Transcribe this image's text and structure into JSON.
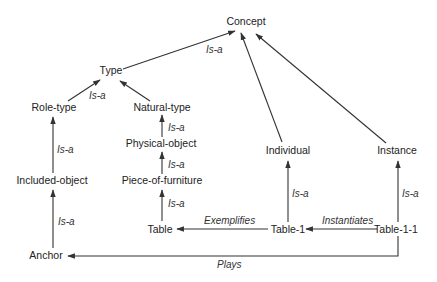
{
  "diagram": {
    "type": "concept-hierarchy",
    "colors": {
      "line": "#333333",
      "text": "#222222",
      "background": "#ffffff"
    },
    "nodes": {
      "concept": {
        "label": "Concept",
        "x": 246,
        "y": 25
      },
      "type": {
        "label": "Type",
        "x": 111,
        "y": 74
      },
      "role_type": {
        "label": "Role-type",
        "x": 54,
        "y": 111
      },
      "natural_type": {
        "label": "Natural-type",
        "x": 162,
        "y": 111
      },
      "physical_object": {
        "label": "Physical-object",
        "x": 161,
        "y": 147
      },
      "piece_of_furniture": {
        "label": "Piece-of-furniture",
        "x": 162,
        "y": 184
      },
      "table": {
        "label": "Table",
        "x": 160,
        "y": 233
      },
      "included_object": {
        "label": "Included-object",
        "x": 62,
        "y": 184
      },
      "anchor": {
        "label": "Anchor",
        "x": 46,
        "y": 258
      },
      "individual": {
        "label": "Individual",
        "x": 288,
        "y": 154
      },
      "instance": {
        "label": "Instance",
        "x": 397,
        "y": 154
      },
      "table_1": {
        "label": "Table-1",
        "x": 288,
        "y": 233
      },
      "table_1_1": {
        "label": "Table-1-1",
        "x": 396,
        "y": 233
      }
    },
    "edges": [
      {
        "from": "type",
        "to": "concept",
        "label": "Is-a"
      },
      {
        "from": "role_type",
        "to": "type",
        "label": "Is-a"
      },
      {
        "from": "natural_type",
        "to": "type",
        "label": ""
      },
      {
        "from": "physical_object",
        "to": "natural_type",
        "label": "Is-a"
      },
      {
        "from": "piece_of_furniture",
        "to": "physical_object",
        "label": "Is-a"
      },
      {
        "from": "table",
        "to": "piece_of_furniture",
        "label": "Is-a"
      },
      {
        "from": "included_object",
        "to": "role_type",
        "label": "Is-a"
      },
      {
        "from": "anchor",
        "to": "included_object",
        "label": "Is-a"
      },
      {
        "from": "individual",
        "to": "concept",
        "label": ""
      },
      {
        "from": "instance",
        "to": "concept",
        "label": ""
      },
      {
        "from": "table_1",
        "to": "individual",
        "label": "Is-a"
      },
      {
        "from": "table_1_1",
        "to": "instance",
        "label": "Is-a"
      },
      {
        "from": "table_1",
        "to": "table",
        "label": "Exemplifies"
      },
      {
        "from": "table_1_1",
        "to": "table_1",
        "label": "Instantiates"
      },
      {
        "from": "table_1_1",
        "to": "anchor",
        "label": "Plays"
      }
    ],
    "edge_labels": {
      "type_concept": "Is-a",
      "role_type_type": "Is-a",
      "physical_object_natural_type": "Is-a",
      "piece_of_furniture_physical_object": "Is-a",
      "table_piece_of_furniture": "Is-a",
      "included_object_role_type": "Is-a",
      "anchor_included_object": "Is-a",
      "table_1_individual": "Is-a",
      "table_1_1_instance": "Is-a",
      "exemplifies": "Exemplifies",
      "instantiates": "Instantiates",
      "plays": "Plays"
    }
  }
}
